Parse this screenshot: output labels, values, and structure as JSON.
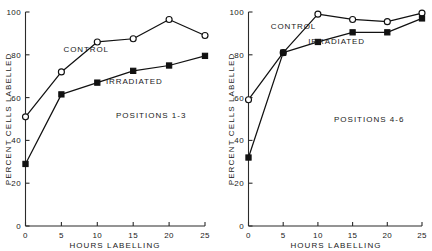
{
  "figure": {
    "panel_count": 2
  },
  "chart_data": [
    {
      "type": "line",
      "title": "",
      "annotation": "POSITIONS 1-3",
      "xlabel": "HOURS LABELLING",
      "ylabel": "PERCENT CELLS LABELLED",
      "x": [
        0,
        5,
        10,
        15,
        20,
        25
      ],
      "xlim": [
        0,
        25
      ],
      "ylim": [
        0,
        100
      ],
      "xticks": [
        0,
        5,
        10,
        15,
        20,
        25
      ],
      "xtick_labels": [
        "0",
        "5",
        "10",
        "15",
        "20",
        "25"
      ],
      "yticks": [
        0,
        20,
        40,
        60,
        80,
        100
      ],
      "ytick_labels": [
        "0",
        "20",
        "40",
        "60",
        "80",
        "100"
      ],
      "grid": false,
      "legend": "inline-annotations",
      "series": [
        {
          "name": "CONTROL",
          "marker": "open-circle",
          "values": [
            51,
            72,
            86,
            87.5,
            96.5,
            89
          ],
          "label_x": 5.3,
          "label_y": 81.5
        },
        {
          "name": "IRRADIATED",
          "marker": "filled-square",
          "values": [
            29,
            61.5,
            67,
            72.5,
            75,
            79.5
          ],
          "label_x": 11.2,
          "label_y": 66.5
        }
      ]
    },
    {
      "type": "line",
      "title": "",
      "annotation": "POSITIONS 4-6",
      "xlabel": "HOURS LABELLING",
      "ylabel": "PERCENT CELLS LABELLED",
      "x": [
        0,
        5,
        10,
        15,
        20,
        25
      ],
      "xlim": [
        0,
        25
      ],
      "ylim": [
        0,
        100
      ],
      "xticks": [
        0,
        5,
        10,
        15,
        20,
        25
      ],
      "xtick_labels": [
        "0",
        "5",
        "10",
        "15",
        "20",
        "25"
      ],
      "yticks": [
        0,
        20,
        40,
        60,
        80,
        100
      ],
      "ytick_labels": [
        "0",
        "20",
        "40",
        "60",
        "80",
        "100"
      ],
      "grid": false,
      "legend": "inline-annotations",
      "series": [
        {
          "name": "CONTROL",
          "marker": "open-circle",
          "values": [
            59,
            81,
            99,
            96.5,
            95.5,
            99.5
          ],
          "label_x": 3.2,
          "label_y": 92
        },
        {
          "name": "IRRADIATED",
          "marker": "filled-square",
          "values": [
            32,
            81,
            86,
            90.5,
            90.5,
            97
          ],
          "label_x": 8.6,
          "label_y": 85
        }
      ]
    }
  ],
  "colors": {
    "ink": "#111111",
    "axis": "#2b2b2b",
    "background": "#ffffff"
  }
}
